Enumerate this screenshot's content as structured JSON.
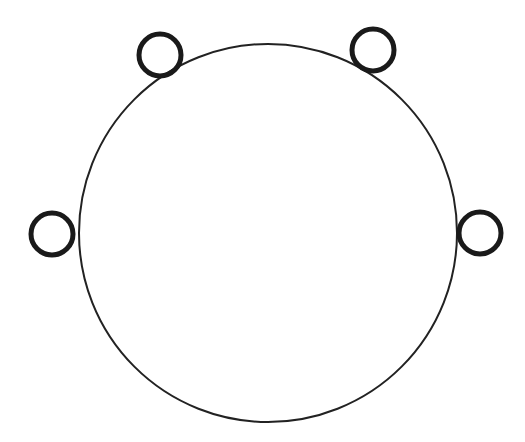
{
  "diagram": {
    "background": "#ffffff",
    "main_circle": {
      "cx": 268,
      "cy": 233,
      "r": 189,
      "stroke": "#222222",
      "stroke_width": 2
    },
    "small_circles": [
      {
        "id": "top-left",
        "cx": 160,
        "cy": 55,
        "r": 21,
        "stroke": "#1a1a1a",
        "stroke_width": 5
      },
      {
        "id": "top-right",
        "cx": 373,
        "cy": 50,
        "r": 21,
        "stroke": "#1a1a1a",
        "stroke_width": 5
      },
      {
        "id": "left",
        "cx": 52,
        "cy": 234,
        "r": 21,
        "stroke": "#1a1a1a",
        "stroke_width": 5
      },
      {
        "id": "right",
        "cx": 480,
        "cy": 233,
        "r": 21,
        "stroke": "#1a1a1a",
        "stroke_width": 5
      }
    ]
  }
}
